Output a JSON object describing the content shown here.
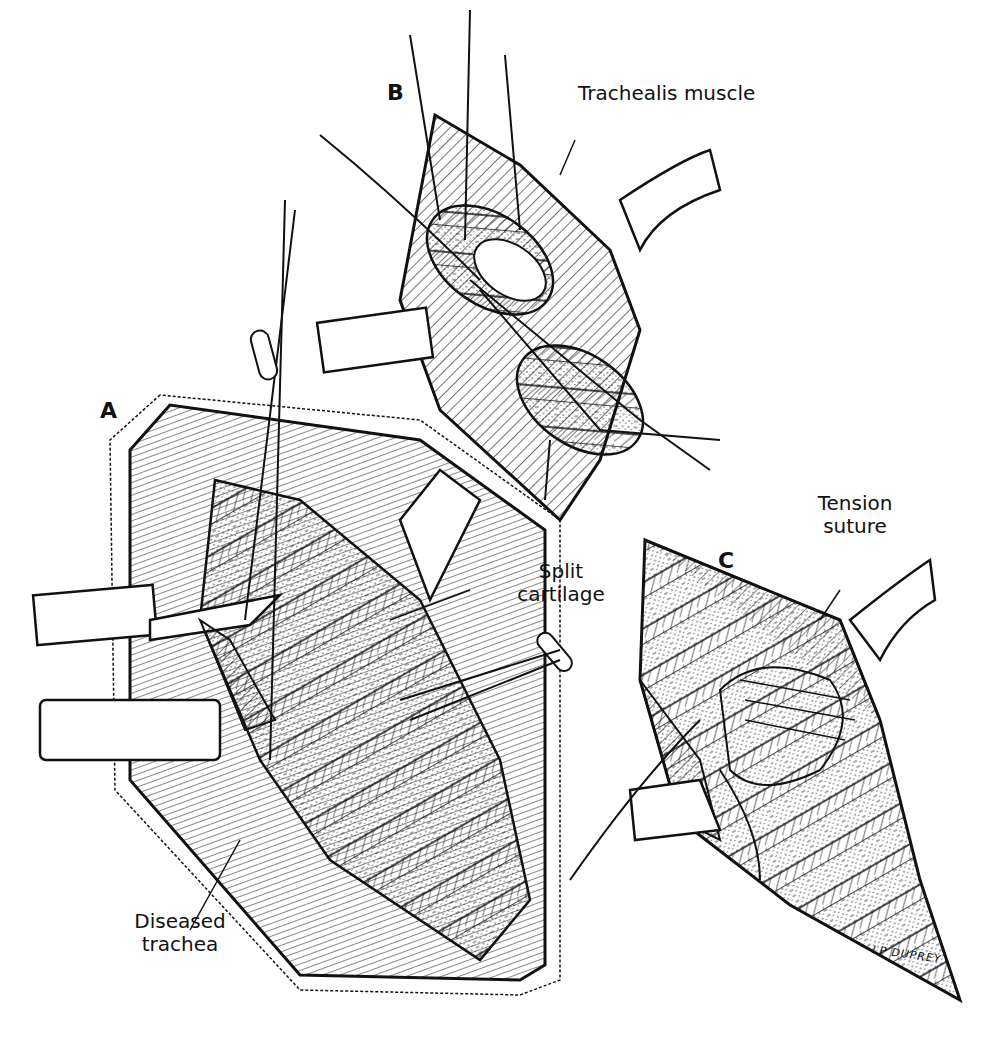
{
  "figure": {
    "panels": [
      {
        "letter": "A",
        "labels": [
          "Split cartilage",
          "Diseased trachea"
        ]
      },
      {
        "letter": "B",
        "labels": [
          "Trachealis muscle"
        ]
      },
      {
        "letter": "C",
        "labels": [
          "Tension suture"
        ]
      }
    ],
    "labels": {
      "panel_a": "A",
      "panel_b": "B",
      "panel_c": "C",
      "trachealis_muscle": "Trachealis muscle",
      "split_line1": "Split",
      "split_line2": "cartilage",
      "diseased_line1": "Diseased",
      "diseased_line2": "trachea",
      "tension_line1": "Tension",
      "tension_line2": "suture"
    },
    "signature": "LP DUPREY",
    "colors": {
      "ink": "#111111",
      "background": "#ffffff"
    }
  }
}
